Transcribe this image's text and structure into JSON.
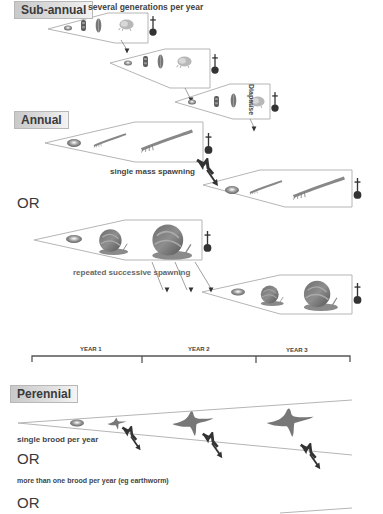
{
  "sub_annual": {
    "label": "Sub-annual",
    "description": "several generations per year",
    "diapause_label": "Diapause",
    "generations": 3
  },
  "annual": {
    "label": "Annual",
    "option_a_caption": "single mass spawning",
    "or_label": "OR",
    "option_b_caption": "repeated successive spawning"
  },
  "timeline": {
    "years": [
      "YEAR 1",
      "YEAR 2",
      "YEAR 3"
    ]
  },
  "perennial": {
    "label": "Perennial",
    "caption_single": "single brood per year",
    "or_1": "OR",
    "caption_multiple": "more than one brood per year (eg earthworm)",
    "or_2": "OR"
  },
  "icons": {
    "death": "death-cross-icon",
    "egg": "egg-icon",
    "spawn_arrow": "spawning-arrow-icon"
  },
  "colors": {
    "outline": "#b5b5b5",
    "label_bg": "#d4d4d4",
    "text": "#3a3a3a",
    "organism": "#7a7a7a"
  }
}
